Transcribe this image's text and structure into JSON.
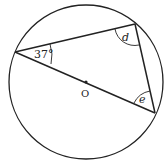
{
  "diagram": {
    "type": "circle-geometry",
    "circle": {
      "center_label": "O"
    },
    "angles": {
      "given": "37°",
      "unknown_1": "d",
      "unknown_2": "e"
    },
    "colors": {
      "stroke": "#222222",
      "background": "#ffffff"
    }
  }
}
